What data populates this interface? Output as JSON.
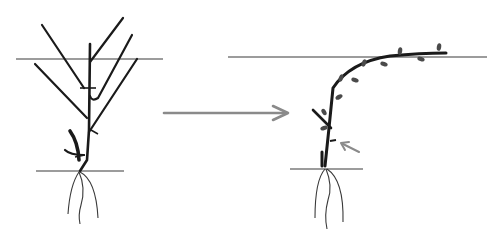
{
  "diagram": {
    "type": "pruning-training-illustration",
    "panels": [
      {
        "id": "before",
        "description": "unpruned plant with multiple shoots crossing the support wire"
      },
      {
        "id": "after",
        "description": "single cane trained up and along the support wire, with buds"
      }
    ],
    "transition_arrow": {
      "direction": "right"
    },
    "colors": {
      "stroke_dark": "#1a1a1a",
      "stroke_line": "#3a3a3a",
      "arrow": "#8a8a8a",
      "bud": "#4a4a4a",
      "background": "#ffffff"
    }
  }
}
